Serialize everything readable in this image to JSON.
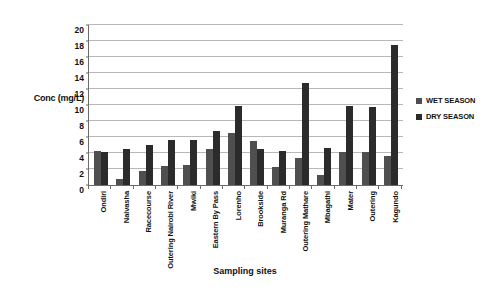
{
  "chart_data": {
    "type": "bar",
    "title": "",
    "xlabel": "Sampling sites",
    "ylabel": "Conc (mg/L)",
    "ylim": [
      0,
      20
    ],
    "ytick_step": 2,
    "yticks": [
      20,
      18,
      16,
      14,
      12,
      10,
      8,
      6,
      4,
      2,
      0
    ],
    "grid": true,
    "legend_position": "right",
    "categories": [
      "Ondiri",
      "Naivasha",
      "Racecourse",
      "Outering Nairobi River",
      "Mwiki",
      "Eastern By Pass",
      "Lorenho",
      "Brookside",
      "Muranga Rd",
      "Outering Mathare",
      "Mbagathi",
      "Mater",
      "Outering",
      "Kagundo"
    ],
    "series": [
      {
        "name": "WET SEASON",
        "color": "#4f4f4f",
        "values": [
          4.3,
          0.8,
          1.8,
          2.4,
          2.5,
          4.5,
          6.5,
          5.5,
          2.2,
          3.4,
          1.2,
          4.1,
          4.1,
          3.6
        ]
      },
      {
        "name": "DRY SEASON",
        "color": "#2b2b2b",
        "values": [
          4.1,
          4.5,
          5.0,
          5.6,
          5.6,
          6.8,
          9.9,
          4.5,
          4.2,
          12.8,
          4.6,
          9.9,
          9.8,
          17.5
        ]
      }
    ]
  }
}
